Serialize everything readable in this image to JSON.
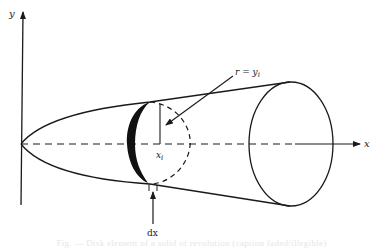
{
  "figure": {
    "type": "solid-of-revolution-disk-method",
    "labels": {
      "y_axis": "y",
      "x_axis": "x",
      "radius": "r = y",
      "radius_subscript": "i",
      "disk_position": "x",
      "disk_position_subscript": "i",
      "thickness": "dx"
    },
    "caption": "Fig. — Disk element of a solid of revolution (caption faded/illegible)",
    "colors": {
      "stroke": "#1a1a1a",
      "disk_fill": "#111111",
      "background": "#ffffff",
      "caption": "#e6e6e6"
    }
  }
}
